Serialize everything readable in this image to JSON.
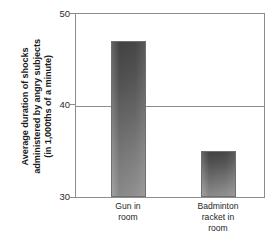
{
  "chart_data": {
    "type": "bar",
    "title": "",
    "subtitle": "",
    "xlabel": "",
    "ylabel": "Average duration of shocks administered by angry subjects (in 1,000ths of a minute)",
    "ylabel_lines": [
      "Average duration of shocks",
      "administered by angry subjects",
      "(in 1,000ths of a minute)"
    ],
    "categories": [
      "Gun in room",
      "Badminton racket in room"
    ],
    "category_lines": [
      [
        "Gun in",
        "room"
      ],
      [
        "Badminton",
        "racket in",
        "room"
      ]
    ],
    "values": [
      47,
      35
    ],
    "ylim": [
      30,
      50
    ],
    "yticks": [
      "50",
      "40",
      "30"
    ],
    "ytick_values": [
      50,
      40,
      30
    ],
    "grid": true,
    "gridlines_at": [
      40
    ],
    "legend": "none",
    "bar_color_top": "#464646",
    "bar_color_bottom": "#909090",
    "axis_color": "#8d8d8d",
    "text_color": "#1a1a1a"
  }
}
